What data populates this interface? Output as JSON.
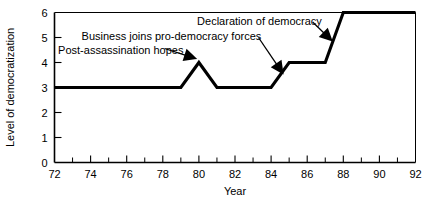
{
  "chart_data": {
    "type": "line",
    "title": "",
    "xlabel": "Year",
    "ylabel": "Level of democratization",
    "xlim": [
      72,
      92
    ],
    "ylim": [
      0,
      6
    ],
    "grid": false,
    "legend": false,
    "x_ticks": [
      72,
      74,
      76,
      78,
      80,
      82,
      84,
      86,
      88,
      90,
      92
    ],
    "x_tick_labels": [
      "72",
      "74",
      "76",
      "78",
      "80",
      "82",
      "84",
      "86",
      "88",
      "90",
      "92"
    ],
    "x_minor_tick_step": 1,
    "y_ticks": [
      0,
      1,
      2,
      3,
      4,
      5,
      6
    ],
    "y_tick_labels": [
      "0",
      "1",
      "2",
      "3",
      "4",
      "5",
      "6"
    ],
    "series": [
      {
        "name": "Level of democratization",
        "color": "#000000",
        "x": [
          72,
          79,
          80,
          81,
          84,
          85,
          87,
          88,
          92
        ],
        "values": [
          3,
          3,
          4,
          3,
          3,
          4,
          4,
          6,
          6
        ]
      }
    ],
    "annotations": [
      {
        "text": "Post-assassination hopes",
        "label_x": 72.2,
        "label_y": 4.52,
        "anchor": "start",
        "point_x": 79.75,
        "point_y": 4.18,
        "leader_from_x": 78.1,
        "leader_from_y": 4.56
      },
      {
        "text": "Business joins pro-democracy forces",
        "label_x": 73.5,
        "label_y": 5.08,
        "anchor": "start",
        "point_x": 84.6,
        "point_y": 3.62,
        "leader_from_x": 83.3,
        "leader_from_y": 5.0
      },
      {
        "text": "Declaration of democracy",
        "label_x": 79.9,
        "label_y": 5.68,
        "anchor": "start",
        "point_x": 87.3,
        "point_y": 4.92,
        "leader_from_x": 86.3,
        "leader_from_y": 5.62
      }
    ]
  }
}
